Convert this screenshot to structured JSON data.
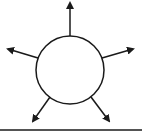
{
  "diagram": {
    "colors": {
      "stroke": "#1a1a1a",
      "fill": "#ffffff",
      "background": "#ffffff"
    },
    "circle": {
      "cx": 70,
      "cy": 70,
      "r": 34
    },
    "arrows": [
      {
        "name": "arrow-up",
        "x1": 70,
        "y1": 36,
        "x2": 70,
        "y2": 3
      },
      {
        "name": "arrow-upper-left",
        "x1": 38,
        "y1": 58,
        "x2": 8,
        "y2": 49
      },
      {
        "name": "arrow-upper-right",
        "x1": 102,
        "y1": 58,
        "x2": 133,
        "y2": 49
      },
      {
        "name": "arrow-lower-left",
        "x1": 50,
        "y1": 97,
        "x2": 33,
        "y2": 121
      },
      {
        "name": "arrow-lower-right",
        "x1": 91,
        "y1": 97,
        "x2": 109,
        "y2": 121
      }
    ],
    "surface_line": {
      "x1": 0,
      "y1": 130,
      "x2": 142,
      "y2": 130
    }
  }
}
